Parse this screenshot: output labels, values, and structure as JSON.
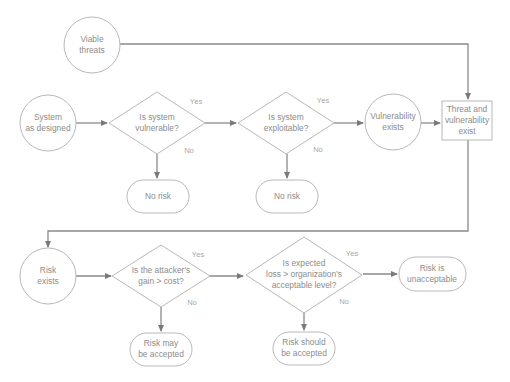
{
  "diagram": {
    "type": "flowchart",
    "colors": {
      "stroke": "#b8b8b8",
      "line": "#8a8a8a",
      "text": "#8c8c8c"
    },
    "nodes": {
      "viable_threats": {
        "line1": "Viable",
        "line2": "threats"
      },
      "system_as_designed": {
        "line1": "System",
        "line2": "as designed"
      },
      "is_vulnerable": {
        "line1": "Is system",
        "line2": "vulnerable?"
      },
      "is_exploitable": {
        "line1": "Is system",
        "line2": "exploitable?"
      },
      "vulnerability_exists": {
        "line1": "Vulnerability",
        "line2": "exists"
      },
      "threat_and_vuln": {
        "line1": "Threat and",
        "line2": "vulnerability",
        "line3": "exist"
      },
      "no_risk_1": {
        "line1": "No risk"
      },
      "no_risk_2": {
        "line1": "No risk"
      },
      "risk_exists": {
        "line1": "Risk",
        "line2": "exists"
      },
      "gain_gt_cost": {
        "line1": "Is the attacker's",
        "line2": "gain > cost?"
      },
      "loss_gt_level": {
        "line1": "Is expected",
        "line2": "loss > organization's",
        "line3": "acceptable level?"
      },
      "risk_unacceptable": {
        "line1": "Risk is",
        "line2": "unacceptable"
      },
      "risk_may_accept": {
        "line1": "Risk may",
        "line2": "be accepted"
      },
      "risk_should_accept": {
        "line1": "Risk should",
        "line2": "be accepted"
      }
    },
    "edge_labels": {
      "yes": "Yes",
      "no": "No"
    }
  }
}
